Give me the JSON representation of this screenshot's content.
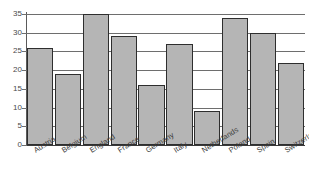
{
  "chart_data": {
    "type": "bar",
    "title": "",
    "subtitle": "",
    "xlabel": "",
    "ylabel": "",
    "categories": [
      "Austria",
      "Belgium",
      "England",
      "France",
      "Germany",
      "Italy",
      "Netherlands",
      "Poland",
      "Spain",
      "Switzerland"
    ],
    "values": [
      26,
      19,
      35,
      29,
      16,
      27,
      9,
      34,
      30,
      22
    ],
    "ylim": [
      0,
      35
    ],
    "yticks": [
      0,
      5,
      10,
      15,
      20,
      25,
      30,
      35
    ],
    "ytick_labels": [
      "0",
      "5",
      "10",
      "15",
      "20",
      "25",
      "30",
      "35"
    ],
    "grid": true,
    "grid_axis": "y",
    "legend": false,
    "legend_position": "none",
    "bar_fill_color": "#b5b5b5",
    "bar_edge_color": "#2e2e2e",
    "gridline_color": "#6e6e6e",
    "axis_color": "#3a3a3a",
    "background_color": "#ffffff"
  }
}
